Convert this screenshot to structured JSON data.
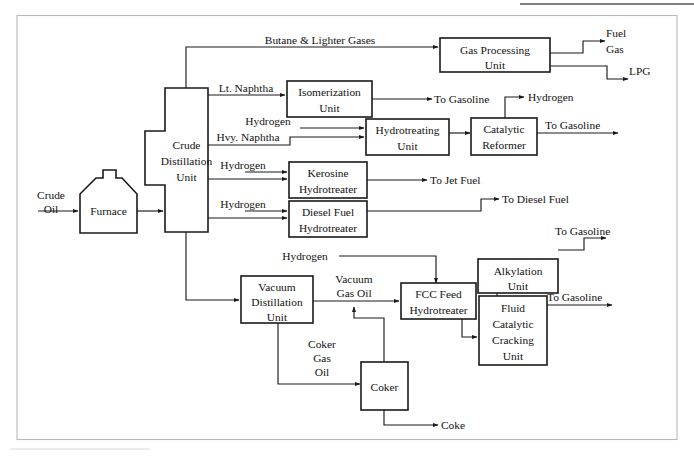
{
  "diagram": {
    "colors": {
      "line": "#1a1a1a",
      "frame": "#b9b9b9",
      "background": "#ffffff",
      "top_rule": "#555555"
    },
    "units": [
      {
        "id": "furnace",
        "label_lines": [
          "Furnace"
        ]
      },
      {
        "id": "crude-distillation",
        "label_lines": [
          "Crude",
          "Distillation",
          "Unit"
        ]
      },
      {
        "id": "gas-processing",
        "label_lines": [
          "Gas Processing",
          "Unit"
        ]
      },
      {
        "id": "isomerization",
        "label_lines": [
          "Isomerization",
          "Unit"
        ]
      },
      {
        "id": "hydrotreating",
        "label_lines": [
          "Hydrotreating",
          "Unit"
        ]
      },
      {
        "id": "catalytic-reformer",
        "label_lines": [
          "Catalytic",
          "Reformer"
        ]
      },
      {
        "id": "kerosine-hydrotreater",
        "label_lines": [
          "Kerosine",
          "Hydrotreater"
        ]
      },
      {
        "id": "diesel-hydrotreater",
        "label_lines": [
          "Diesel Fuel",
          "Hydrotreater"
        ]
      },
      {
        "id": "vacuum-distillation",
        "label_lines": [
          "Vacuum",
          "Distillation",
          "Unit"
        ]
      },
      {
        "id": "fcc-feed-hydrotreater",
        "label_lines": [
          "FCC Feed",
          "Hydrotreater"
        ]
      },
      {
        "id": "alkylation",
        "label_lines": [
          "Alkylation",
          "Unit"
        ]
      },
      {
        "id": "fluid-catalytic-cracking",
        "label_lines": [
          "Fluid",
          "Catalytic",
          "Cracking",
          "Unit"
        ]
      },
      {
        "id": "coker",
        "label_lines": [
          "Coker"
        ]
      }
    ],
    "unit_labels": {
      "furnace": "Furnace",
      "crude_distillation_1": "Crude",
      "crude_distillation_2": "Distillation",
      "crude_distillation_3": "Unit",
      "gas_processing_1": "Gas Processing",
      "gas_processing_2": "Unit",
      "isomerization_1": "Isomerization",
      "isomerization_2": "Unit",
      "hydrotreating_1": "Hydrotreating",
      "hydrotreating_2": "Unit",
      "catalytic_reformer_1": "Catalytic",
      "catalytic_reformer_2": "Reformer",
      "kerosine_hydrotreater_1": "Kerosine",
      "kerosine_hydrotreater_2": "Hydrotreater",
      "diesel_hydrotreater_1": "Diesel Fuel",
      "diesel_hydrotreater_2": "Hydrotreater",
      "vacuum_distillation_1": "Vacuum",
      "vacuum_distillation_2": "Distillation",
      "vacuum_distillation_3": "Unit",
      "fcc_feed_hydrotreater_1": "FCC Feed",
      "fcc_feed_hydrotreater_2": "Hydrotreater",
      "alkylation_1": "Alkylation",
      "alkylation_2": "Unit",
      "fcc_1": "Fluid",
      "fcc_2": "Catalytic",
      "fcc_3": "Cracking",
      "fcc_4": "Unit",
      "coker": "Coker"
    },
    "stream_labels": {
      "crude_oil_1": "Crude",
      "crude_oil_2": "Oil",
      "butane_lighter_gases": "Butane & Lighter Gases",
      "fuel_gas_1": "Fuel",
      "fuel_gas_2": "Gas",
      "lpg": "LPG",
      "lt_naphtha": "Lt. Naphtha",
      "to_gasoline_isom": "To Gasoline",
      "hydrogen_hydrotreating": "Hydrogen",
      "hvy_naphtha": "Hvy. Naphtha",
      "hydrogen_product": "Hydrogen",
      "to_gasoline_reformer": "To Gasoline",
      "hydrogen_kerosine": "Hydrogen",
      "to_jet_fuel": "To Jet Fuel",
      "hydrogen_diesel": "Hydrogen",
      "to_diesel_fuel": "To Diesel Fuel",
      "hydrogen_fcc_feed": "Hydrogen",
      "vacuum_gas_oil_1": "Vacuum",
      "vacuum_gas_oil_2": "Gas Oil",
      "coker_gas_oil_1": "Coker",
      "coker_gas_oil_2": "Gas",
      "coker_gas_oil_3": "Oil",
      "coke": "Coke",
      "to_gasoline_alkylation": "To Gasoline",
      "to_gasoline_fcc": "To Gasoline"
    }
  }
}
